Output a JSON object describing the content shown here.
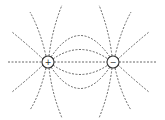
{
  "diagram": {
    "charges": [
      {
        "id": "positive",
        "symbol": "+",
        "cx": 48,
        "cy": 62,
        "r": 6
      },
      {
        "id": "negative",
        "symbol": "−",
        "cx": 113,
        "cy": 62,
        "r": 6
      }
    ],
    "line_color": "#555555",
    "line_style": "dashed"
  }
}
